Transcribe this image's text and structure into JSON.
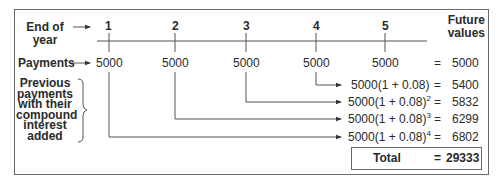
{
  "diagram": {
    "row_labels": {
      "end_of_year": [
        "End of",
        "year"
      ],
      "payments": "Payments",
      "previous": [
        "Previous",
        "payments",
        "with their",
        "compound",
        "interest",
        "added"
      ]
    },
    "column_header": [
      "Future",
      "values"
    ],
    "years": [
      "1",
      "2",
      "3",
      "4",
      "5"
    ],
    "payments": [
      "5000",
      "5000",
      "5000",
      "5000",
      "5000"
    ],
    "equals": "=",
    "direct_value": "5000",
    "compound_rows": [
      {
        "expr": "5000(1 + 0.08)",
        "exponent": "",
        "value": "5400",
        "from_year": "4"
      },
      {
        "expr": "5000(1 + 0.08)",
        "exponent": "2",
        "value": "5832",
        "from_year": "3"
      },
      {
        "expr": "5000(1 + 0.08)",
        "exponent": "3",
        "value": "6299",
        "from_year": "2"
      },
      {
        "expr": "5000(1 + 0.08)",
        "exponent": "4",
        "value": "6802",
        "from_year": "1"
      }
    ],
    "total": {
      "label": "Total",
      "value": "29333"
    },
    "colors": {
      "line": "#555555",
      "text": "#2a2a2a",
      "border": "#6a6a6a"
    }
  }
}
